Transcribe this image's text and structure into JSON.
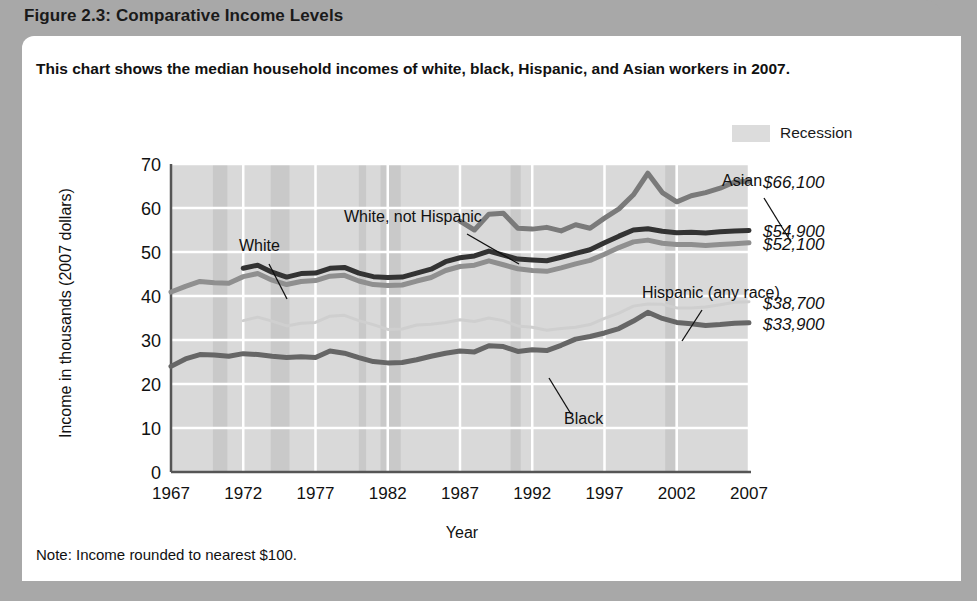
{
  "figure": {
    "header_title": "Figure 2.3: Comparative Income Levels",
    "subtitle": "This chart shows the median household incomes of white, black, Hispanic, and Asian workers in 2007.",
    "note": "Note: Income rounded to nearest $100."
  },
  "legend": {
    "swatch_label": "Recession",
    "swatch_color": "#dcdcdc"
  },
  "colors": {
    "white_not_hispanic": "#333333",
    "white": "#8f8f8f",
    "asian": "#7a7a7a",
    "black": "#666666",
    "hispanic": "#cfcfcf",
    "plot_background": "#d9d9d9",
    "recession_band": "#c9c9c9",
    "gridline": "#ffffff",
    "axis": "#555555"
  },
  "chart_data": {
    "type": "line",
    "title": "Comparative Income Levels",
    "xlabel": "Year",
    "ylabel": "Income in thousands (2007 dollars)",
    "xlim": [
      1967,
      2007
    ],
    "ylim": [
      0,
      70
    ],
    "ytick_labels": [
      "0",
      "10",
      "20",
      "30",
      "40",
      "50",
      "60",
      "70"
    ],
    "ytick_values": [
      0,
      10,
      20,
      30,
      40,
      50,
      60,
      70
    ],
    "xtick_labels": [
      "1967",
      "1972",
      "1977",
      "1982",
      "1987",
      "1992",
      "1997",
      "2002",
      "2007"
    ],
    "xtick_values": [
      1967,
      1972,
      1977,
      1982,
      1987,
      1992,
      1997,
      2002,
      2007
    ],
    "grid": true,
    "legend_position": "top-right",
    "units": "thousands of 2007 dollars",
    "series": [
      {
        "name": "Asian",
        "annotation": "Asian",
        "end_label": "$66,100",
        "color": "#7a7a7a",
        "x": [
          1987,
          1988,
          1989,
          1990,
          1991,
          1992,
          1993,
          1994,
          1995,
          1996,
          1997,
          1998,
          1999,
          2000,
          2001,
          2002,
          2003,
          2004,
          2005,
          2006,
          2007
        ],
        "values": [
          57.0,
          55.0,
          58.6,
          58.8,
          55.4,
          55.2,
          55.6,
          54.8,
          56.2,
          55.4,
          57.7,
          59.8,
          63.0,
          67.9,
          63.5,
          61.4,
          62.8,
          63.5,
          64.5,
          65.9,
          66.1
        ]
      },
      {
        "name": "White, not Hispanic",
        "annotation": "White, not Hispanic",
        "end_label": "$54,900",
        "color": "#333333",
        "x": [
          1972,
          1973,
          1974,
          1975,
          1976,
          1977,
          1978,
          1979,
          1980,
          1981,
          1982,
          1983,
          1984,
          1985,
          1986,
          1987,
          1988,
          1989,
          1990,
          1991,
          1992,
          1993,
          1994,
          1995,
          1996,
          1997,
          1998,
          1999,
          2000,
          2001,
          2002,
          2003,
          2004,
          2005,
          2006,
          2007
        ],
        "values": [
          46.3,
          47.0,
          45.4,
          44.3,
          45.1,
          45.2,
          46.3,
          46.5,
          45.2,
          44.4,
          44.2,
          44.3,
          45.2,
          46.1,
          47.8,
          48.7,
          49.1,
          50.2,
          49.3,
          48.4,
          48.2,
          48.0,
          48.8,
          49.7,
          50.5,
          52.1,
          53.6,
          55.0,
          55.3,
          54.7,
          54.4,
          54.5,
          54.3,
          54.6,
          54.8,
          54.9
        ]
      },
      {
        "name": "White",
        "annotation": "White",
        "end_label": "$52,100",
        "color": "#8f8f8f",
        "x": [
          1967,
          1968,
          1969,
          1970,
          1971,
          1972,
          1973,
          1974,
          1975,
          1976,
          1977,
          1978,
          1979,
          1980,
          1981,
          1982,
          1983,
          1984,
          1985,
          1986,
          1987,
          1988,
          1989,
          1990,
          1991,
          1992,
          1993,
          1994,
          1995,
          1996,
          1997,
          1998,
          1999,
          2000,
          2001,
          2002,
          2003,
          2004,
          2005,
          2006,
          2007
        ],
        "values": [
          40.9,
          42.2,
          43.3,
          43.0,
          42.9,
          44.4,
          45.1,
          43.6,
          42.6,
          43.3,
          43.5,
          44.5,
          44.7,
          43.4,
          42.6,
          42.4,
          42.5,
          43.4,
          44.2,
          45.8,
          46.7,
          47.0,
          48.0,
          47.1,
          46.2,
          45.8,
          45.6,
          46.4,
          47.3,
          48.1,
          49.5,
          51.0,
          52.3,
          52.7,
          52.0,
          51.7,
          51.7,
          51.5,
          51.7,
          51.9,
          52.1
        ]
      },
      {
        "name": "Hispanic (any race)",
        "annotation": "Hispanic (any race)",
        "end_label": "$38,700",
        "color": "#cfcfcf",
        "x": [
          1972,
          1973,
          1974,
          1975,
          1976,
          1977,
          1978,
          1979,
          1980,
          1981,
          1982,
          1983,
          1984,
          1985,
          1986,
          1987,
          1988,
          1989,
          1990,
          1991,
          1992,
          1993,
          1994,
          1995,
          1996,
          1997,
          1998,
          1999,
          2000,
          2001,
          2002,
          2003,
          2004,
          2005,
          2006,
          2007
        ],
        "values": [
          34.4,
          35.2,
          34.3,
          33.2,
          33.8,
          34.0,
          35.4,
          35.6,
          34.4,
          33.5,
          32.4,
          32.5,
          33.4,
          33.6,
          34.0,
          34.6,
          34.2,
          35.0,
          34.4,
          33.2,
          32.9,
          32.2,
          32.6,
          32.9,
          33.5,
          34.9,
          36.1,
          37.7,
          38.2,
          38.1,
          37.3,
          37.3,
          37.5,
          38.0,
          38.6,
          38.7
        ]
      },
      {
        "name": "Black",
        "annotation": "Black",
        "end_label": "$33,900",
        "color": "#666666",
        "x": [
          1967,
          1968,
          1969,
          1970,
          1971,
          1972,
          1973,
          1974,
          1975,
          1976,
          1977,
          1978,
          1979,
          1980,
          1981,
          1982,
          1983,
          1984,
          1985,
          1986,
          1987,
          1988,
          1989,
          1990,
          1991,
          1992,
          1993,
          1994,
          1995,
          1996,
          1997,
          1998,
          1999,
          2000,
          2001,
          2002,
          2003,
          2004,
          2005,
          2006,
          2007
        ],
        "values": [
          24.0,
          25.7,
          26.7,
          26.6,
          26.3,
          26.9,
          26.7,
          26.3,
          26.0,
          26.2,
          26.0,
          27.5,
          27.0,
          26.0,
          25.1,
          24.8,
          24.9,
          25.5,
          26.3,
          27.0,
          27.5,
          27.3,
          28.7,
          28.5,
          27.4,
          27.8,
          27.6,
          28.8,
          30.2,
          30.8,
          31.6,
          32.6,
          34.3,
          36.3,
          34.9,
          34.0,
          33.7,
          33.3,
          33.5,
          33.8,
          33.9
        ]
      }
    ],
    "recession_bands": [
      {
        "start": 1969.9,
        "end": 1970.9
      },
      {
        "start": 1973.9,
        "end": 1975.2
      },
      {
        "start": 1980.0,
        "end": 1980.5
      },
      {
        "start": 1981.5,
        "end": 1982.9
      },
      {
        "start": 1990.5,
        "end": 1991.2
      },
      {
        "start": 2001.2,
        "end": 2001.9
      }
    ],
    "annotations": [
      {
        "text": "White",
        "x": 120,
        "y": 95
      },
      {
        "text": "White, not Hispanic",
        "x": 225,
        "y": 66
      },
      {
        "text": "Asian",
        "x": 603,
        "y": 30
      },
      {
        "text": "Hispanic (any race)",
        "x": 523,
        "y": 142
      },
      {
        "text": "Black",
        "x": 445,
        "y": 268
      }
    ]
  }
}
